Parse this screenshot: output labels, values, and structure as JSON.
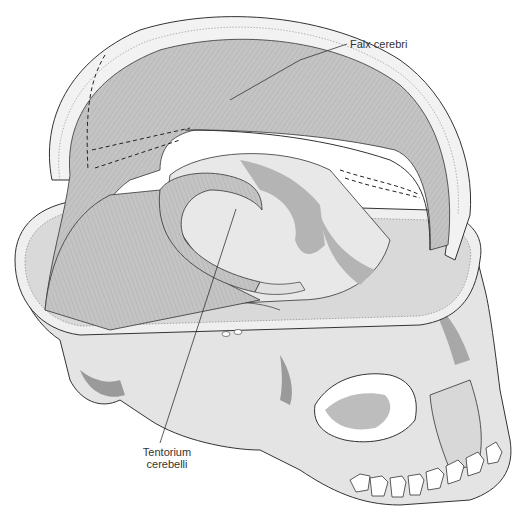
{
  "figure": {
    "labels": [
      {
        "id": "falx",
        "text": "Falx cerebri"
      },
      {
        "id": "tentorium",
        "line1": "Tentorium",
        "line2": "cerebelli"
      }
    ]
  },
  "colors": {
    "bone_light": "#e6e6e6",
    "bone_mid": "#c8c8c8",
    "bone_dark": "#9a9a9a",
    "dura": "#bdbdbd",
    "outline": "#333333",
    "leader": "#333333"
  }
}
